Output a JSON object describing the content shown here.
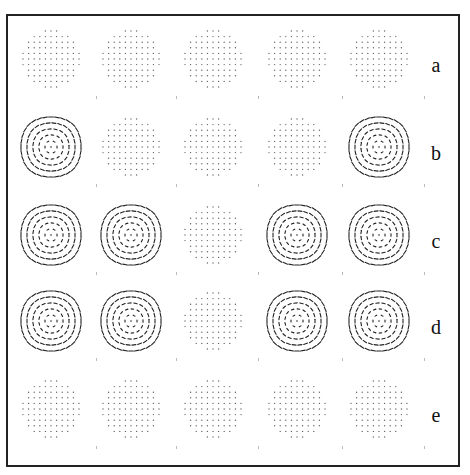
{
  "figure": {
    "row_labels": [
      "a",
      "b",
      "c",
      "d",
      "e"
    ],
    "columns": 5,
    "grid": [
      [
        "dots",
        "dots",
        "dots",
        "dots",
        "dots"
      ],
      [
        "vortex",
        "dots",
        "dots",
        "dots",
        "vortex"
      ],
      [
        "vortex",
        "vortex",
        "dots",
        "vortex",
        "vortex"
      ],
      [
        "vortex",
        "vortex",
        "dots",
        "vortex",
        "vortex"
      ],
      [
        "dots",
        "dots",
        "dots",
        "dots",
        "dots"
      ]
    ]
  },
  "colors": {
    "ink": "#222222",
    "dots": "#666666",
    "background": "#ffffff"
  }
}
